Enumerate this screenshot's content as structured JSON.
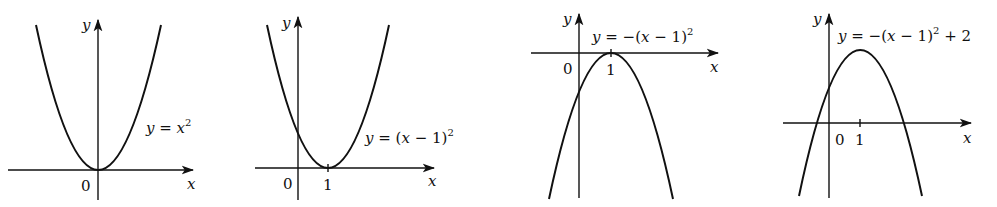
{
  "figure": {
    "graphs": [
      {
        "id": "g1",
        "equation": "y = x²",
        "eq_parts": {
          "y": "y",
          "rest": " = ",
          "x": "x",
          "sup": "2"
        },
        "x_label": "x",
        "y_label": "y",
        "origin_label": "0",
        "tick_labels": []
      },
      {
        "id": "g2",
        "equation": "y = (x − 1)²",
        "x_label": "x",
        "y_label": "y",
        "origin_label": "0",
        "tick_labels": [
          "1"
        ]
      },
      {
        "id": "g3",
        "equation": "y = −(x − 1)²",
        "x_label": "x",
        "y_label": "y",
        "origin_label": "0",
        "tick_labels": [
          "1"
        ]
      },
      {
        "id": "g4",
        "equation": "y = −(x − 1)² + 2",
        "x_label": "x",
        "y_label": "y",
        "origin_label": "0",
        "tick_labels": [
          "1"
        ]
      }
    ]
  },
  "labels": {
    "y": "y",
    "x": "x",
    "zero": "0",
    "one": "1",
    "eq1_lhs": "y",
    "eq1_mid": " = ",
    "eq1_x": "x",
    "sup2": "2",
    "eq2_lhs": "y",
    "eq2_mid": " = (",
    "eq2_x": "x",
    "eq2_tail": " − 1)",
    "eq3_lhs": "y",
    "eq3_mid": " = −(",
    "eq3_x": "x",
    "eq3_tail": " − 1)",
    "eq4_lhs": "y",
    "eq4_mid": " = −(",
    "eq4_x": "x",
    "eq4_tail": " − 1)",
    "eq4_end": " + 2"
  }
}
